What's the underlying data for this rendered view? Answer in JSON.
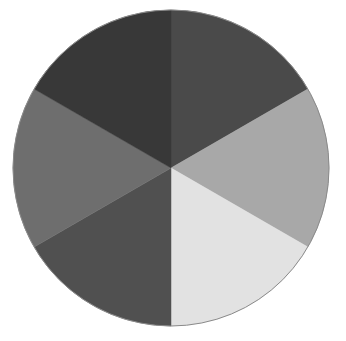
{
  "figure": {
    "background_color": "#ffffff",
    "width": 346,
    "height": 341
  },
  "disc": {
    "name": "six-segment-grayscale-disc",
    "center_x": 171,
    "center_y": 168,
    "radius": 158,
    "outline_color": "#8a8a8a",
    "outline_width": 1,
    "segment_count": 6,
    "segment_angle_degrees": 60,
    "start_angle_degrees": 0
  },
  "chart_data": {
    "type": "pie",
    "xlabel": "",
    "ylabel": "",
    "legend_position": "none",
    "grid": false,
    "categories": [
      "top-right",
      "right",
      "bottom-right",
      "bottom-left",
      "left",
      "top-left"
    ],
    "values": [
      16.6667,
      16.6667,
      16.6667,
      16.6667,
      16.6667,
      16.6667
    ],
    "colors": [
      "#4a4a4a",
      "#a8a8a8",
      "#e2e2e2",
      "#505050",
      "#6e6e6e",
      "#383838"
    ],
    "slices": [
      {
        "label": "top-right",
        "value": 16.6667,
        "color": "#4a4a4a",
        "start_angle": 0,
        "end_angle": 60
      },
      {
        "label": "right",
        "value": 16.6667,
        "color": "#a8a8a8",
        "start_angle": 60,
        "end_angle": 120
      },
      {
        "label": "bottom-right",
        "value": 16.6667,
        "color": "#e2e2e2",
        "start_angle": 120,
        "end_angle": 180
      },
      {
        "label": "bottom-left",
        "value": 16.6667,
        "color": "#505050",
        "start_angle": 180,
        "end_angle": 240
      },
      {
        "label": "left",
        "value": 16.6667,
        "color": "#6e6e6e",
        "start_angle": 240,
        "end_angle": 300
      },
      {
        "label": "top-left",
        "value": 16.6667,
        "color": "#383838",
        "start_angle": 300,
        "end_angle": 360
      }
    ]
  }
}
